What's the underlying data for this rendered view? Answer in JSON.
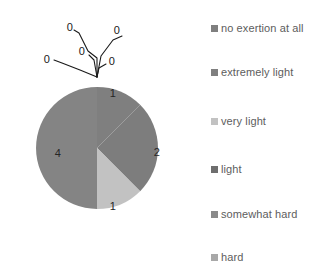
{
  "chart_data": {
    "type": "pie",
    "title": "",
    "legend_position": "right",
    "categories": [
      "no exertion at all",
      "extremely light",
      "very light",
      "light",
      "somewhat hard",
      "hard"
    ],
    "values": [
      0,
      1,
      1,
      2,
      4,
      0
    ],
    "total": 8,
    "data_labels": [
      "0",
      "1",
      "1",
      "2",
      "4",
      "0"
    ],
    "colors": [
      "#808080",
      "#7f7f7f",
      "#bfbfbf",
      "#6e6e6e",
      "#8a8a8a",
      "#a8a8a8"
    ],
    "zero_callout_labels": [
      "0",
      "0",
      "0",
      "0"
    ],
    "visible_slices": [
      {
        "category": "extremely light",
        "value": 1,
        "label": "1",
        "start_angle": 0,
        "sweep": 45,
        "color": "#7f7f7f"
      },
      {
        "category": "light",
        "value": 2,
        "label": "2",
        "start_angle": 45,
        "sweep": 90,
        "color": "#7d7d7d"
      },
      {
        "category": "very light",
        "value": 1,
        "label": "1",
        "start_angle": 135,
        "sweep": 45,
        "color": "#c2c2c2"
      },
      {
        "category": "somewhat hard",
        "value": 4,
        "label": "4",
        "start_angle": 180,
        "sweep": 180,
        "color": "#848484"
      }
    ]
  },
  "pie": {
    "center_x": 97,
    "center_y": 148,
    "radius": 61,
    "slice_labels": [
      {
        "text": "1",
        "x": 113,
        "y": 93
      },
      {
        "text": "2",
        "x": 157,
        "y": 152
      },
      {
        "text": "1",
        "x": 113,
        "y": 206
      },
      {
        "text": "4",
        "x": 58,
        "y": 153
      }
    ],
    "callouts": [
      {
        "text": "0",
        "x": 70,
        "y": 27
      },
      {
        "text": "0",
        "x": 117,
        "y": 30
      },
      {
        "text": "0",
        "x": 82,
        "y": 51
      },
      {
        "text": "0",
        "x": 112,
        "y": 61
      },
      {
        "text": "0",
        "x": 47,
        "y": 59
      }
    ]
  },
  "legend": {
    "items": [
      {
        "label": "no exertion at all",
        "color": "#7f7f7f",
        "y": 22
      },
      {
        "label": "extremely light",
        "color": "#7f7f7f",
        "y": 66
      },
      {
        "label": "very light",
        "color": "#c2c2c2",
        "y": 115
      },
      {
        "label": "light",
        "color": "#6e6e6e",
        "y": 163
      },
      {
        "label": "somewhat hard",
        "color": "#8a8a8a",
        "y": 208
      },
      {
        "label": "hard",
        "color": "#a8a8a8",
        "y": 251
      }
    ]
  }
}
